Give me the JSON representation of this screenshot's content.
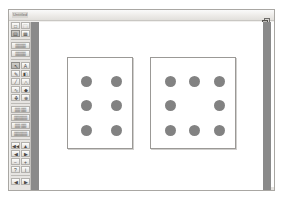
{
  "window": {
    "title": "Untitled",
    "restore_icon": "restore-window-icon"
  },
  "palette": {
    "groups": [
      {
        "name": "file-group",
        "rows": [
          {
            "buttons": [
              {
                "name": "new-document-button",
                "glyph": "□"
              },
              {
                "name": "open-document-button",
                "glyph": "⬚"
              }
            ]
          },
          {
            "buttons": [
              {
                "name": "page-view-button",
                "glyph": "▤",
                "selected": true
              },
              {
                "name": "page-layout-button",
                "glyph": "▦"
              }
            ]
          }
        ]
      },
      {
        "name": "text-style-group",
        "labels": [
          {
            "name": "font-size-field",
            "text": "▒▒▒▒"
          },
          {
            "name": "font-style-field",
            "text": "▒▒▒▒"
          }
        ]
      },
      {
        "name": "drawing-tools-group",
        "rows": [
          {
            "buttons": [
              {
                "name": "pointer-tool-button",
                "glyph": "↖",
                "selected": true
              },
              {
                "name": "text-tool-button",
                "glyph": "A"
              }
            ]
          },
          {
            "buttons": [
              {
                "name": "pencil-tool-button",
                "glyph": "✎"
              },
              {
                "name": "eraser-tool-button",
                "glyph": "◧"
              }
            ]
          },
          {
            "buttons": [
              {
                "name": "line-tool-button",
                "glyph": "╱"
              },
              {
                "name": "shape-tool-button",
                "glyph": "△"
              }
            ]
          },
          {
            "buttons": [
              {
                "name": "curve-tool-button",
                "glyph": "∿"
              },
              {
                "name": "fill-tool-button",
                "glyph": "◆"
              }
            ]
          },
          {
            "buttons": [
              {
                "name": "stamp-tool-button",
                "glyph": "❖"
              },
              {
                "name": "zoom-tool-button",
                "glyph": "⊕"
              }
            ]
          }
        ]
      },
      {
        "name": "command-group",
        "labels": [
          {
            "name": "undo-button",
            "text": "▒▒ ▒▒"
          },
          {
            "name": "copy-button",
            "text": "▒▒▒▒▒"
          },
          {
            "name": "paste-button",
            "text": "▒▒ ▒▒"
          },
          {
            "name": "clear-button",
            "text": "▒▒▒▒▒"
          }
        ]
      },
      {
        "name": "navigation-group",
        "rows": [
          {
            "buttons": [
              {
                "name": "first-page-button",
                "glyph": "◀◀"
              },
              {
                "name": "page-up-button",
                "glyph": "▲"
              }
            ]
          },
          {
            "buttons": [
              {
                "name": "previous-page-button",
                "glyph": "◀"
              },
              {
                "name": "next-page-button",
                "glyph": "▶"
              }
            ]
          },
          {
            "buttons": [
              {
                "name": "zoom-out-button",
                "glyph": "−"
              },
              {
                "name": "zoom-in-button",
                "glyph": "+"
              }
            ]
          },
          {
            "buttons": [
              {
                "name": "help-button",
                "glyph": "?"
              },
              {
                "name": "info-button",
                "glyph": "i"
              }
            ]
          }
        ]
      },
      {
        "name": "playback-group",
        "rows": [
          {
            "buttons": [
              {
                "name": "rewind-button",
                "glyph": "◀"
              },
              {
                "name": "play-button",
                "glyph": "▶"
              }
            ]
          }
        ]
      }
    ]
  },
  "canvas": {
    "boxes": [
      {
        "name": "dot-box-left",
        "label": "six-dot-array",
        "dot_count": 6,
        "rect": {
          "x": 28,
          "y": 35,
          "w": 66,
          "h": 92
        },
        "dot_color": "#828282",
        "dot_diameter": 11,
        "dots": [
          {
            "cx": 18,
            "cy": 23
          },
          {
            "cx": 48,
            "cy": 23
          },
          {
            "cx": 18,
            "cy": 47
          },
          {
            "cx": 48,
            "cy": 47
          },
          {
            "cx": 18,
            "cy": 72
          },
          {
            "cx": 48,
            "cy": 72
          }
        ]
      },
      {
        "name": "dot-box-right",
        "label": "eight-dot-array",
        "dot_count": 8,
        "rect": {
          "x": 111,
          "y": 35,
          "w": 86,
          "h": 92
        },
        "dot_color": "#828282",
        "dot_diameter": 11,
        "dots": [
          {
            "cx": 19,
            "cy": 23
          },
          {
            "cx": 43,
            "cy": 23
          },
          {
            "cx": 68,
            "cy": 23
          },
          {
            "cx": 19,
            "cy": 47
          },
          {
            "cx": 68,
            "cy": 47
          },
          {
            "cx": 19,
            "cy": 72
          },
          {
            "cx": 43,
            "cy": 72
          },
          {
            "cx": 68,
            "cy": 72
          }
        ]
      }
    ]
  },
  "colors": {
    "gutter": "#8a8a8a",
    "chrome": "#e6e4e1",
    "dot": "#828282",
    "box_border": "#9b9996"
  }
}
